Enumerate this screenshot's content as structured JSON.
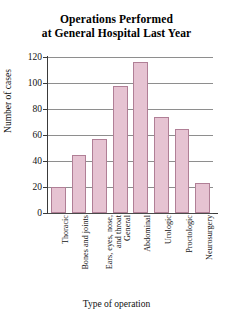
{
  "chart_data": {
    "type": "bar",
    "title": "Operations Performed at General Hospital Last Year",
    "title_lines": [
      "Operations Performed",
      "at General Hospital Last Year"
    ],
    "xlabel": "Type of operation",
    "ylabel": "Number of cases",
    "categories": [
      "Thoracic",
      "Bones and joints",
      "Ears, eyes, nose, and throat",
      "General",
      "Abdominal",
      "Urologic",
      "Proctologic",
      "Neurosurgery"
    ],
    "category_lines": [
      [
        "Thoracic"
      ],
      [
        "Bones and joints"
      ],
      [
        "Ears, eyes, nose,",
        "and throat"
      ],
      [
        "General"
      ],
      [
        "Abdominal"
      ],
      [
        "Urologic"
      ],
      [
        "Proctologic"
      ],
      [
        "Neurosurgery"
      ]
    ],
    "values": [
      20,
      45,
      57,
      98,
      116,
      74,
      65,
      23
    ],
    "ylim": [
      0,
      120
    ],
    "yticks": [
      0,
      20,
      40,
      60,
      80,
      100,
      120
    ],
    "ytick_labels": [
      "0",
      "20",
      "40",
      "60",
      "80",
      "100",
      "120"
    ],
    "grid": true,
    "legend": false,
    "bar_fill_color": "#e6c3d2",
    "bar_border_color": "#b07f96",
    "gridline_color": "#8e8e8e",
    "axis_color": "#3a3a3a",
    "background_color": "#ffffff"
  }
}
